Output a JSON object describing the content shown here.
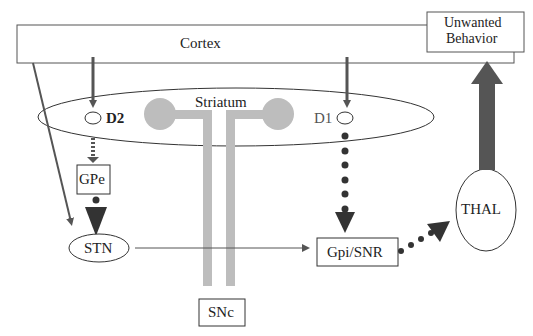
{
  "diagram": {
    "nodes": {
      "cortex": "Cortex",
      "unwanted_line1": "Unwanted",
      "unwanted_line2": "Behavior",
      "striatum": "Striatum",
      "d2": "D2",
      "d1": "D1",
      "gpe": "GPe",
      "stn": "STN",
      "gpi_snr": "Gpi/SNR",
      "thal": "THAL",
      "snc": "SNc"
    },
    "colors": {
      "arrow": "#555555",
      "dopamine": "#bdbdbd",
      "outline": "#333333"
    }
  }
}
